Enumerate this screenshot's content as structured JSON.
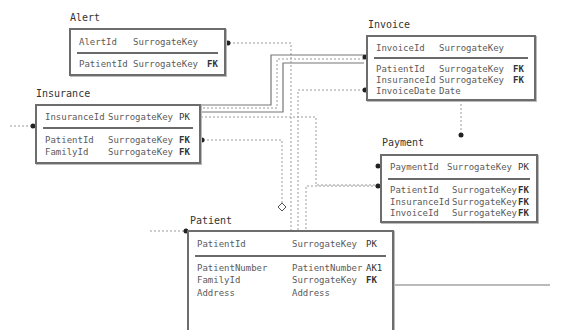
{
  "diagram": {
    "type": "entity-relationship",
    "entities": [
      {
        "name": "Alert",
        "key_fields": [
          {
            "field": "AlertId",
            "type": "SurrogateKey",
            "key": ""
          }
        ],
        "fields": [
          {
            "field": "PatientId",
            "type": "SurrogateKey",
            "key": "FK"
          }
        ]
      },
      {
        "name": "Invoice",
        "key_fields": [
          {
            "field": "InvoiceId",
            "type": "SurrogateKey",
            "key": ""
          }
        ],
        "fields": [
          {
            "field": "PatientId",
            "type": "SurrogateKey",
            "key": "FK"
          },
          {
            "field": "InsuranceId",
            "type": "SurrogateKey",
            "key": "FK"
          },
          {
            "field": "InvoiceDate",
            "type": "Date",
            "key": ""
          }
        ]
      },
      {
        "name": "Insurance",
        "key_fields": [
          {
            "field": "InsuranceId",
            "type": "SurrogateKey",
            "key": "PK"
          }
        ],
        "fields": [
          {
            "field": "PatientId",
            "type": "SurrogateKey",
            "key": "FK"
          },
          {
            "field": "FamilyId",
            "type": "SurrogateKey",
            "key": "FK"
          }
        ]
      },
      {
        "name": "Payment",
        "key_fields": [
          {
            "field": "PaymentId",
            "type": "SurrogateKey",
            "key": "PK"
          }
        ],
        "fields": [
          {
            "field": "PatientId",
            "type": "SurrogateKey",
            "key": "FK"
          },
          {
            "field": "InsuranceId",
            "type": "SurrogateKey",
            "key": "FK"
          },
          {
            "field": "InvoiceId",
            "type": "SurrogateKey",
            "key": "FK"
          }
        ]
      },
      {
        "name": "Patient",
        "key_fields": [
          {
            "field": "PatientId",
            "type": "SurrogateKey",
            "key": "PK"
          }
        ],
        "fields": [
          {
            "field": "PatientNumber",
            "type": "PatientNumber",
            "key": "AK1"
          },
          {
            "field": "FamilyId",
            "type": "SurrogateKey",
            "key": "FK"
          },
          {
            "field": "Address",
            "type": "Address",
            "key": ""
          }
        ]
      }
    ],
    "relationships": [
      {
        "from": "Alert",
        "to": "Patient",
        "style": "dashed",
        "end": "dot"
      },
      {
        "from": "Insurance",
        "to": "Invoice",
        "style": "solid-double",
        "end": "dot"
      },
      {
        "from": "Invoice",
        "to": "Payment",
        "style": "dashed",
        "end": "dot"
      },
      {
        "from": "Insurance",
        "to": "Payment",
        "style": "dashed",
        "end": "dot"
      },
      {
        "from": "Patient",
        "to": "Invoice",
        "style": "dashed",
        "end": "dot"
      },
      {
        "from": "Insurance",
        "to": "Patient",
        "style": "dashed",
        "end": "diamond"
      }
    ],
    "colors": {
      "border": "#6d6d6d",
      "line": "#888888",
      "text": "#555555"
    }
  }
}
